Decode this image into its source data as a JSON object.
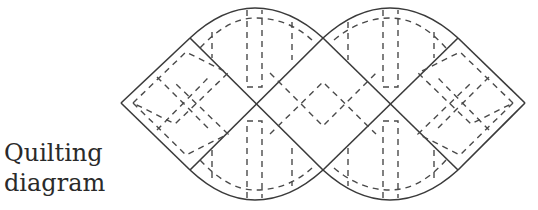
{
  "caption": {
    "line1": "Quilting",
    "line2": "diagram"
  },
  "diagram": {
    "stroke_color": "#3a3a3a",
    "dash_color": "#4a4a4a",
    "background": "#ffffff"
  }
}
